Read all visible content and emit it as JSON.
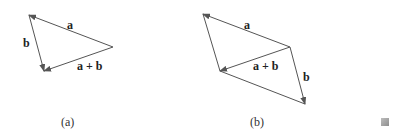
{
  "figure": {
    "panels": [
      {
        "id": "a",
        "caption": "(a)",
        "labels": {
          "a": "a",
          "b": "b",
          "sum": "a + b"
        },
        "vertices": {
          "top_left": [
            29,
            15
          ],
          "right": [
            113,
            47
          ],
          "bottom": [
            44,
            71
          ]
        },
        "vectors": [
          {
            "name": "a",
            "from": "right",
            "to": "top_left"
          },
          {
            "name": "b",
            "from": "top_left",
            "to": "bottom"
          },
          {
            "name": "a + b",
            "from": "right",
            "to": "bottom"
          }
        ]
      },
      {
        "id": "b",
        "caption": "(b)",
        "labels": {
          "a": "a",
          "b": "b",
          "sum": "a + b"
        },
        "vertices": {
          "top_left": [
            203,
            14
          ],
          "right": [
            290,
            47
          ],
          "left_bottom": [
            220,
            71
          ],
          "bottom_right": [
            305,
            104
          ]
        },
        "vectors": [
          {
            "name": "a",
            "from": "right",
            "to": "top_left"
          },
          {
            "name": "a + b",
            "from": "right",
            "to": "left_bottom"
          },
          {
            "name": "b",
            "from": "right",
            "to": "bottom_right"
          }
        ],
        "plain_edges": [
          [
            "top_left",
            "left_bottom"
          ],
          [
            "left_bottom",
            "bottom_right"
          ]
        ]
      }
    ],
    "end_marker": "qed-box",
    "colors": {
      "line": "#555555",
      "text": "#222222",
      "box": "#a0a0a0"
    }
  }
}
